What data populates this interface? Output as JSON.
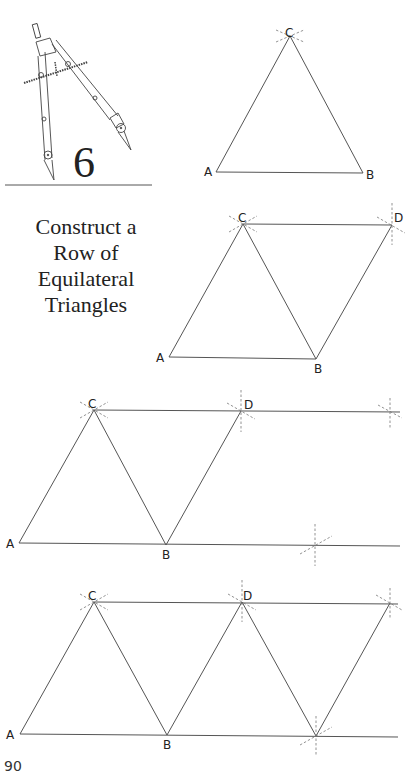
{
  "step": {
    "number": "6",
    "title_lines": [
      "Construct a",
      "Row of",
      "Equilateral",
      "Triangles"
    ]
  },
  "figures": [
    {
      "id": "fig1",
      "points": {
        "A": [
          216,
          172
        ],
        "B": [
          363,
          173
        ],
        "C": [
          290,
          36
        ]
      },
      "labels": [
        "A",
        "B",
        "C"
      ],
      "edges": [
        [
          "A",
          "B"
        ],
        [
          "B",
          "C"
        ],
        [
          "C",
          "A"
        ]
      ]
    },
    {
      "id": "fig2",
      "points": {
        "A": [
          169,
          357
        ],
        "B": [
          316,
          359
        ],
        "C": [
          243,
          224
        ],
        "D": [
          392,
          225
        ]
      },
      "labels": [
        "A",
        "B",
        "C",
        "D"
      ],
      "edges": [
        [
          "A",
          "B"
        ],
        [
          "A",
          "C"
        ],
        [
          "C",
          "B"
        ],
        [
          "C",
          "D"
        ],
        [
          "B",
          "D"
        ]
      ]
    },
    {
      "id": "fig3",
      "points": {
        "A": [
          19,
          543
        ],
        "B": [
          166,
          545
        ],
        "C": [
          94,
          410
        ],
        "D": [
          241,
          411
        ]
      },
      "labels": [
        "A",
        "B",
        "C",
        "D"
      ],
      "edges": [
        [
          "A",
          "C"
        ],
        [
          "C",
          "B"
        ],
        [
          "B",
          "D"
        ]
      ],
      "extended_lines": [
        [
          [
            19,
            543
          ],
          [
            400,
            546
          ]
        ],
        [
          [
            94,
            410
          ],
          [
            400,
            412
          ]
        ]
      ]
    },
    {
      "id": "fig4",
      "points": {
        "A": [
          20,
          734
        ],
        "B": [
          167,
          735
        ],
        "C": [
          94,
          602
        ],
        "D": [
          242,
          602
        ],
        "E": [
          316,
          736
        ],
        "F": [
          390,
          603
        ]
      },
      "labels": [
        "A",
        "B",
        "C",
        "D"
      ],
      "edges": [
        [
          "A",
          "C"
        ],
        [
          "C",
          "B"
        ],
        [
          "B",
          "D"
        ],
        [
          "D",
          "E"
        ],
        [
          "E",
          "F"
        ]
      ],
      "extended_lines": [
        [
          [
            20,
            734
          ],
          [
            398,
            737
          ]
        ],
        [
          [
            94,
            602
          ],
          [
            398,
            604
          ]
        ]
      ]
    }
  ],
  "page_number": "90",
  "colors": {
    "line": "#555555",
    "arc": "#777777",
    "text": "#222222"
  }
}
